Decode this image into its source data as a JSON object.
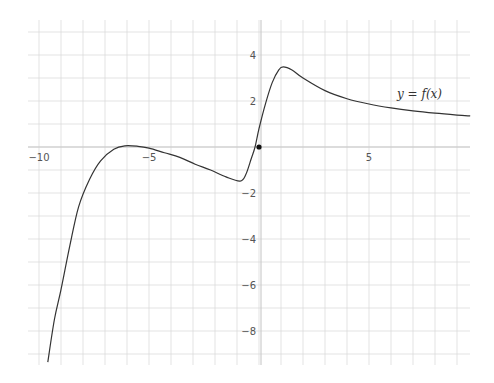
{
  "chart_data": {
    "type": "line",
    "title": "",
    "xlabel": "",
    "ylabel": "",
    "xlim": [
      -10.5,
      9.6
    ],
    "ylim": [
      -9.5,
      5.5
    ],
    "grid": true,
    "grid_step": 1,
    "x_ticks": [
      {
        "value": -10,
        "label": "-10"
      },
      {
        "value": -5,
        "label": "-5"
      },
      {
        "value": 5,
        "label": "5"
      }
    ],
    "y_ticks": [
      {
        "value": 4,
        "label": "4"
      },
      {
        "value": 2,
        "label": "2"
      },
      {
        "value": -2,
        "label": "-2"
      },
      {
        "value": -4,
        "label": "-4"
      },
      {
        "value": -6,
        "label": "-6"
      },
      {
        "value": -8,
        "label": "-8"
      }
    ],
    "series": [
      {
        "name": "y = f(x)",
        "color": "#333333",
        "points": [
          [
            -9.6,
            -9.35
          ],
          [
            -9.3,
            -7.5
          ],
          [
            -9.0,
            -6.2
          ],
          [
            -8.6,
            -4.3
          ],
          [
            -8.2,
            -2.6
          ],
          [
            -7.7,
            -1.4
          ],
          [
            -7.2,
            -0.6
          ],
          [
            -6.6,
            -0.1
          ],
          [
            -6.1,
            0.05
          ],
          [
            -5.5,
            0.03
          ],
          [
            -5.0,
            -0.05
          ],
          [
            -4.3,
            -0.25
          ],
          [
            -3.6,
            -0.45
          ],
          [
            -2.9,
            -0.75
          ],
          [
            -2.2,
            -1.0
          ],
          [
            -1.5,
            -1.3
          ],
          [
            -0.86,
            -1.48
          ],
          [
            -0.6,
            -1.2
          ],
          [
            -0.35,
            -0.5
          ],
          [
            -0.18,
            0.0
          ],
          [
            0.0,
            0.8
          ],
          [
            0.3,
            1.9
          ],
          [
            0.6,
            2.8
          ],
          [
            0.9,
            3.35
          ],
          [
            1.1,
            3.48
          ],
          [
            1.5,
            3.35
          ],
          [
            2.0,
            3.0
          ],
          [
            3.0,
            2.45
          ],
          [
            4.0,
            2.1
          ],
          [
            5.0,
            1.87
          ],
          [
            6.0,
            1.7
          ],
          [
            7.0,
            1.57
          ],
          [
            8.0,
            1.47
          ],
          [
            9.0,
            1.39
          ],
          [
            9.6,
            1.35
          ]
        ]
      }
    ],
    "annotations": [
      {
        "text": "y = f(x)",
        "x": 6.3,
        "y": 2.4
      }
    ],
    "marked_point": {
      "x": 0,
      "y": 0
    }
  },
  "labels": {
    "function_label": "y = f(x)",
    "x_ticks": [
      "-10",
      "-5",
      "5"
    ],
    "y_ticks": [
      "4",
      "2",
      "-2",
      "-4",
      "-6",
      "-8"
    ]
  },
  "colors": {
    "grid": "#dcdcdc",
    "axis": "#c8c8c8",
    "curve": "#333333",
    "point": "#111111",
    "text": "#555555"
  }
}
